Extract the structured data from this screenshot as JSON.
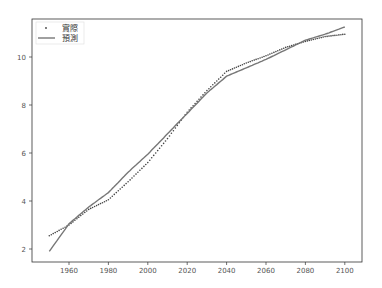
{
  "chart_data": {
    "type": "line",
    "title": "",
    "xlabel": "",
    "ylabel": "",
    "xlim": [
      1942,
      2108
    ],
    "ylim": [
      1.45,
      11.6
    ],
    "grid": false,
    "legend_position": "upper left",
    "x_ticks": [
      1960,
      1980,
      2000,
      2020,
      2040,
      2060,
      2080,
      2100
    ],
    "y_ticks": [
      2,
      4,
      6,
      8,
      10
    ],
    "x": [
      1950,
      1960,
      1970,
      1980,
      1990,
      2000,
      2010,
      2020,
      2030,
      2040,
      2050,
      2060,
      2070,
      2080,
      2090,
      2100
    ],
    "series": [
      {
        "name": "實際",
        "style": "dots",
        "color": "#444444",
        "values": [
          2.55,
          3.0,
          3.65,
          4.05,
          4.8,
          5.6,
          6.6,
          7.7,
          8.6,
          9.4,
          9.75,
          10.05,
          10.4,
          10.65,
          10.85,
          10.95
        ]
      },
      {
        "name": "預測",
        "style": "line",
        "color": "#777777",
        "values": [
          1.9,
          3.05,
          3.75,
          4.35,
          5.2,
          5.95,
          6.8,
          7.65,
          8.5,
          9.2,
          9.55,
          9.9,
          10.3,
          10.7,
          10.95,
          11.25
        ]
      }
    ]
  }
}
